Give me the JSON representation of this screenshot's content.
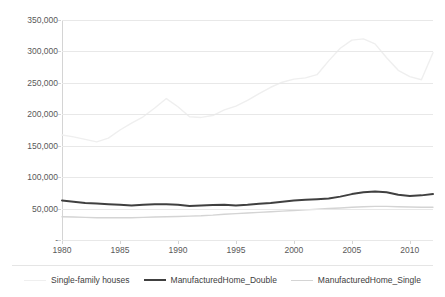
{
  "chart_data": {
    "type": "line",
    "title": "",
    "xlabel": "",
    "ylabel": "",
    "xlim": [
      1980,
      2012
    ],
    "ylim": [
      0,
      350000
    ],
    "ytick_values": [
      0,
      50000,
      100000,
      150000,
      200000,
      250000,
      300000,
      350000
    ],
    "ytick_labels": [
      "-",
      "50,000",
      "100,000",
      "150,000",
      "200,000",
      "250,000",
      "300,000",
      "350,000"
    ],
    "xtick_values": [
      1980,
      1985,
      1990,
      1995,
      2000,
      2005,
      2010
    ],
    "xtick_labels": [
      "1980",
      "1985",
      "1990",
      "1995",
      "2000",
      "2005",
      "2010"
    ],
    "grid": true,
    "legend_position": "bottom",
    "x": [
      1980,
      1981,
      1982,
      1983,
      1984,
      1985,
      1986,
      1987,
      1988,
      1989,
      1990,
      1991,
      1992,
      1993,
      1994,
      1995,
      1996,
      1997,
      1998,
      1999,
      2000,
      2001,
      2002,
      2003,
      2004,
      2005,
      2006,
      2007,
      2008,
      2009,
      2010,
      2011,
      2012
    ],
    "series": [
      {
        "name": "Single-family houses",
        "color": "#efefef",
        "width": 1.4,
        "values": [
          167000,
          164000,
          160000,
          156000,
          162000,
          175000,
          186000,
          196000,
          210000,
          225000,
          212000,
          196000,
          195000,
          198000,
          207000,
          213000,
          222000,
          233000,
          243000,
          251000,
          256000,
          258000,
          263000,
          285000,
          305000,
          318000,
          320000,
          312000,
          290000,
          270000,
          260000,
          255000,
          298000
        ]
      },
      {
        "name": "ManufacturedHome_Double",
        "color": "#404040",
        "width": 2.0,
        "values": [
          63000,
          61000,
          59000,
          58000,
          57000,
          56000,
          55000,
          56000,
          57000,
          57000,
          56000,
          54000,
          55000,
          55500,
          56000,
          55000,
          56000,
          57500,
          59000,
          61000,
          63000,
          64000,
          65000,
          66000,
          69000,
          73000,
          76000,
          77000,
          76000,
          72000,
          70000,
          71000,
          73000
        ]
      },
      {
        "name": "ManufacturedHome_Single",
        "color": "#d4d4d4",
        "width": 1.4,
        "values": [
          37000,
          36500,
          36000,
          35500,
          35500,
          35500,
          35500,
          36000,
          36500,
          37000,
          37500,
          38000,
          38500,
          39500,
          41000,
          42000,
          43000,
          44000,
          45000,
          46000,
          47000,
          48000,
          49000,
          50000,
          51000,
          52000,
          53000,
          53500,
          53500,
          53000,
          52500,
          52000,
          52000
        ]
      }
    ]
  }
}
